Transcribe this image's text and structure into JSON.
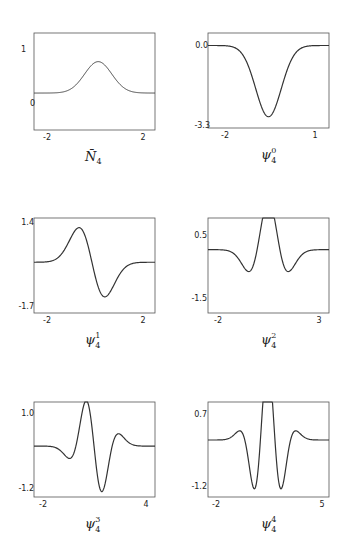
{
  "chart_data": [
    {
      "type": "line",
      "panel": "N4-bar",
      "title": "N̄4",
      "caption": {
        "base": "N̄",
        "sub": "4",
        "sup": ""
      },
      "xlim": [
        -2.6,
        2.3
      ],
      "ylim": [
        -0.8,
        1.3
      ],
      "xticks": [
        -2,
        2
      ],
      "yticks": [
        0,
        1
      ],
      "ytick_labels": [
        "0",
        "1"
      ],
      "xtick_labels": [
        "-2",
        "2"
      ],
      "shape": "gaussian",
      "params": {
        "center": 0.0,
        "amp": 0.68,
        "width": 0.55
      },
      "grid": false
    },
    {
      "type": "line",
      "panel": "psi-4-0",
      "title": "ψ4^0",
      "caption": {
        "base": "ψ",
        "sub": "4",
        "sup": "0"
      },
      "xlim": [
        -2.4,
        1.2
      ],
      "ylim": [
        -3.3,
        0.5
      ],
      "xticks": [
        -2,
        1
      ],
      "yticks": [
        0.0,
        -3.3
      ],
      "ytick_labels": [
        "0.0",
        "-3.3"
      ],
      "xtick_labels": [
        "-2",
        "1"
      ],
      "shape": "neg-gaussian",
      "params": {
        "center": -0.6,
        "amp": -2.85,
        "width": 0.38
      },
      "grid": false
    },
    {
      "type": "line",
      "panel": "psi-4-1",
      "title": "ψ4^1",
      "caption": {
        "base": "ψ",
        "sub": "4",
        "sup": "1"
      },
      "xlim": [
        -2.4,
        2.3
      ],
      "ylim": [
        -1.95,
        1.7
      ],
      "xticks": [
        -2,
        2
      ],
      "yticks": [
        1.4,
        -1.7
      ],
      "ytick_labels": [
        "1.4",
        "-1.7"
      ],
      "xtick_labels": [
        "-2",
        "2"
      ],
      "shape": "hermite-1",
      "params": {
        "center": -0.15,
        "amp": 1.55,
        "width": 0.5
      },
      "grid": false
    },
    {
      "type": "line",
      "panel": "psi-4-2",
      "title": "ψ4^2",
      "caption": {
        "base": "ψ",
        "sub": "4",
        "sup": "2"
      },
      "xlim": [
        -2.2,
        3.1
      ],
      "ylim": [
        -2.0,
        1.0
      ],
      "xticks": [
        -2,
        3
      ],
      "yticks": [
        0.5,
        -1.5
      ],
      "ytick_labels": [
        "0.5",
        "-1.5"
      ],
      "xtick_labels": [
        "-2",
        "3"
      ],
      "shape": "hermite-2",
      "params": {
        "center": 0.45,
        "amp": 1.55,
        "width": 0.5
      },
      "grid": false
    },
    {
      "type": "line",
      "panel": "psi-4-3",
      "title": "ψ4^3",
      "caption": {
        "base": "ψ",
        "sub": "4",
        "sup": "3"
      },
      "xlim": [
        -2.2,
        4.15
      ],
      "ylim": [
        -1.5,
        1.3
      ],
      "xticks": [
        -2,
        4
      ],
      "yticks": [
        1.0,
        -1.2
      ],
      "ytick_labels": [
        "1.0",
        "-1.2"
      ],
      "xtick_labels": [
        "-2",
        "4"
      ],
      "shape": "hermite-3",
      "params": {
        "center": 0.95,
        "amp": 1.1,
        "width": 0.55
      },
      "grid": false
    },
    {
      "type": "line",
      "panel": "psi-4-4",
      "title": "ψ4^4",
      "caption": {
        "base": "ψ",
        "sub": "4",
        "sup": "4"
      },
      "xlim": [
        -2.2,
        5.2
      ],
      "ylim": [
        -1.5,
        1.0
      ],
      "xticks": [
        -2,
        5
      ],
      "yticks": [
        0.7,
        -1.2
      ],
      "ytick_labels": [
        "0.7",
        "-1.2"
      ],
      "xtick_labels": [
        "-2",
        "5"
      ],
      "shape": "hermite-4",
      "params": {
        "center": 1.45,
        "amp": 1.3,
        "width": 0.6
      },
      "grid": false
    }
  ],
  "captions": {
    "p0": {
      "base": "N̄",
      "sub": "4"
    },
    "p1": {
      "base": "ψ",
      "sub": "4",
      "sup": "0"
    },
    "p2": {
      "base": "ψ",
      "sub": "4",
      "sup": "1"
    },
    "p3": {
      "base": "ψ",
      "sub": "4",
      "sup": "2"
    },
    "p4": {
      "base": "ψ",
      "sub": "4",
      "sup": "3"
    },
    "p5": {
      "base": "ψ",
      "sub": "4",
      "sup": "4"
    }
  },
  "ticks": {
    "p0": {
      "y_top": "1",
      "y_bot": "0",
      "x_left": "-2",
      "x_right": "2"
    },
    "p1": {
      "y_top": "0.0",
      "y_bot": "-3.3",
      "x_left": "-2",
      "x_right": "1"
    },
    "p2": {
      "y_top": "1.4",
      "y_bot": "-1.7",
      "x_left": "-2",
      "x_right": "2"
    },
    "p3": {
      "y_top": "0.5",
      "y_bot": "-1.5",
      "x_left": "-2",
      "x_right": "3"
    },
    "p4": {
      "y_top": "1.0",
      "y_bot": "-1.2",
      "x_left": "-2",
      "x_right": "4"
    },
    "p5": {
      "y_top": "0.7",
      "y_bot": "-1.2",
      "x_left": "-2",
      "x_right": "5"
    }
  },
  "colors": {
    "line": "#333333",
    "frame": "#555555",
    "text": "#222222",
    "background": "#ffffff"
  }
}
